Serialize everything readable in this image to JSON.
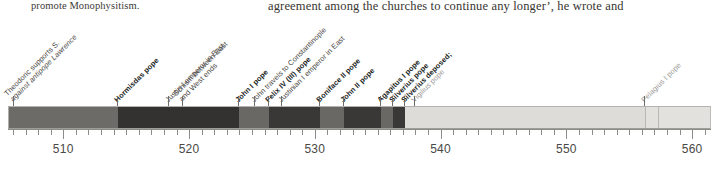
{
  "page": {
    "text_left": "promote Monophysitism.",
    "text_right": "agreement among the churches to continue any longer’, he wrote and"
  },
  "chart_data": {
    "type": "bar",
    "title": "",
    "xlabel": "",
    "ylabel": "",
    "orientation": "horizontal-timeline",
    "grid": false,
    "legend_position": "none",
    "xlim": [
      505.6,
      561.5
    ],
    "axis": {
      "major_ticks": [
        510,
        520,
        530,
        540,
        550,
        560
      ],
      "major_tick_labels": [
        "510",
        "520",
        "530",
        "540",
        "550",
        "560"
      ],
      "minor_tick_interval": 1
    },
    "segments": [
      {
        "label": "Symmachus pope",
        "start": 505.6,
        "end": 514.3,
        "color": "#6d6b68"
      },
      {
        "label": "Hormisdas pope",
        "start": 514.3,
        "end": 523.9,
        "color": "#333230"
      },
      {
        "label": "John I pope",
        "start": 523.9,
        "end": 526.3,
        "color": "#6a6865"
      },
      {
        "label": "Felix IV (III) pope",
        "start": 526.3,
        "end": 530.3,
        "color": "#3a3836"
      },
      {
        "label": "Boniface II pope",
        "start": 530.3,
        "end": 532.2,
        "color": "#6a6865"
      },
      {
        "label": "John II pope",
        "start": 532.2,
        "end": 535.2,
        "color": "#3a3836"
      },
      {
        "label": "Agapitus I pope",
        "start": 535.2,
        "end": 536.1,
        "color": "#6a6865"
      },
      {
        "label": "Silverius pope",
        "start": 536.1,
        "end": 537.1,
        "color": "#3a3836"
      },
      {
        "label": "Vigilius pope",
        "start": 537.1,
        "end": 556.2,
        "color": "#dedcd9"
      },
      {
        "label": "Pelagius I pope",
        "start": 556.2,
        "end": 561.5,
        "color": "#e3e1de"
      }
    ],
    "interior_rules": [
      556.2,
      557.2
    ],
    "events": [
      {
        "lines": [
          "Theodoric supports S.",
          "against antipope Lawrence"
        ],
        "year": 506.0,
        "style": [
          "normal",
          "italic"
        ],
        "emphasis": "plain"
      },
      {
        "lines": [
          "Hormisdas pope"
        ],
        "year": 514.3,
        "emphasis": "bold"
      },
      {
        "lines": [
          "Justin I emperor in East"
        ],
        "year": 518.3,
        "emphasis": "plain"
      },
      {
        "lines": [
          "Schism between East",
          "and West ends"
        ],
        "year": 519.4,
        "emphasis": "plain"
      },
      {
        "lines": [
          "John I pope"
        ],
        "year": 523.9,
        "emphasis": "bold"
      },
      {
        "lines": [
          "John travels to Constantinople"
        ],
        "year": 525.2,
        "emphasis": "plain"
      },
      {
        "lines": [
          "Felix IV (III) pope"
        ],
        "year": 526.3,
        "emphasis": "bold"
      },
      {
        "lines": [
          "Justinian I emperor in East"
        ],
        "year": 527.3,
        "emphasis": "plain"
      },
      {
        "lines": [
          "Boniface II pope"
        ],
        "year": 530.3,
        "emphasis": "bold"
      },
      {
        "lines": [
          "John II pope"
        ],
        "year": 532.2,
        "emphasis": "bold"
      },
      {
        "lines": [
          "Agapitus I pope"
        ],
        "year": 535.2,
        "emphasis": "bold"
      },
      {
        "lines": [
          "Silverius pope"
        ],
        "year": 536.1,
        "emphasis": "bold"
      },
      {
        "lines": [
          "Silverius deposed;"
        ],
        "year": 537.1,
        "emphasis": "bold"
      },
      {
        "lines": [
          "Vigilius pope"
        ],
        "year": 537.9,
        "emphasis": "pale"
      },
      {
        "lines": [
          "Pelagius I pope"
        ],
        "year": 556.2,
        "emphasis": "pale"
      }
    ]
  }
}
